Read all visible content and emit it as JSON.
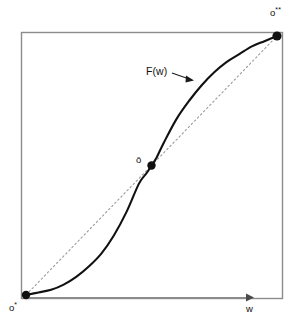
{
  "figure": {
    "kind": "line-diagram",
    "background_color": "#ffffff",
    "frame_color": "#8c8c8c",
    "curve_color": "#111111",
    "chord_color": "#9a9a9a",
    "point_color": "#111111",
    "axis_color": "#8c8c8c"
  },
  "labels": {
    "curve_label": "F(w)",
    "axis_x_label": "w",
    "point_start_base": "o",
    "point_start_sup": "*",
    "point_mid": "ō",
    "point_end_base": "o",
    "point_end_sup": "**"
  },
  "chart_data": {
    "type": "line",
    "title": "",
    "xlabel": "w",
    "ylabel": "",
    "grid": false,
    "legend": null,
    "xlim": [
      0,
      1
    ],
    "ylim": [
      0,
      1
    ],
    "series": [
      {
        "name": "F(w)",
        "style": "solid",
        "color": "#111111",
        "x": [
          0.0,
          0.05,
          0.1,
          0.15,
          0.2,
          0.25,
          0.3,
          0.35,
          0.4,
          0.45,
          0.48,
          0.5,
          0.52,
          0.55,
          0.6,
          0.65,
          0.7,
          0.75,
          0.8,
          0.85,
          0.9,
          0.95,
          1.0
        ],
        "y": [
          0.0,
          0.01,
          0.02,
          0.04,
          0.07,
          0.11,
          0.16,
          0.23,
          0.32,
          0.43,
          0.47,
          0.5,
          0.53,
          0.59,
          0.68,
          0.75,
          0.81,
          0.86,
          0.9,
          0.93,
          0.96,
          0.98,
          1.0
        ]
      },
      {
        "name": "chord",
        "style": "dotted",
        "color": "#9a9a9a",
        "x": [
          0.0,
          1.0
        ],
        "y": [
          0.0,
          1.0
        ]
      }
    ],
    "annotations": [
      {
        "name": "point-start",
        "label": "o*",
        "x": 0.0,
        "y": 0.0,
        "marker": "filled-circle"
      },
      {
        "name": "point-mid",
        "label": "ō",
        "x": 0.5,
        "y": 0.5,
        "marker": "filled-circle"
      },
      {
        "name": "point-end",
        "label": "o**",
        "x": 1.0,
        "y": 1.0,
        "marker": "filled-circle"
      },
      {
        "name": "curve-callout",
        "label": "F(w)",
        "x": 0.5,
        "y": 0.79,
        "marker": "leader-arrow"
      }
    ]
  }
}
